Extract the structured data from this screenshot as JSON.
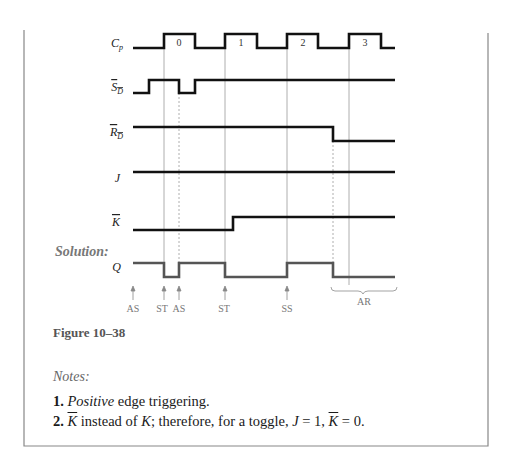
{
  "figure": {
    "caption": "Figure 10–38",
    "solution_label": "Solution:",
    "signals": [
      {
        "name": "Cp",
        "label_main": "C",
        "label_sub": "p",
        "overbar": false
      },
      {
        "name": "SD",
        "label_main": "S",
        "label_sub": "D",
        "overbar": true
      },
      {
        "name": "RD",
        "label_main": "R",
        "label_sub": "D",
        "overbar": true
      },
      {
        "name": "J",
        "label_main": "J",
        "label_sub": "",
        "overbar": false
      },
      {
        "name": "K",
        "label_main": "K",
        "label_sub": "",
        "overbar": true
      },
      {
        "name": "Q",
        "label_main": "Q",
        "label_sub": "",
        "overbar": false
      }
    ],
    "clock_pulses": [
      "0",
      "1",
      "2",
      "3"
    ],
    "event_labels": [
      "AS",
      "ST",
      "AS",
      "ST",
      "SS"
    ],
    "brace_label": "AR"
  },
  "notes": {
    "heading": "Notes:",
    "items": [
      {
        "num": "1.",
        "em": "Positive",
        "text": " edge triggering."
      },
      {
        "num": "2.",
        "k": "K",
        "text1": " instead of ",
        "k2": "K",
        "text2": "; therefore, for a toggle, ",
        "j": "J",
        "text3": " = 1, ",
        "k3": "K",
        "text4": " = 0."
      }
    ]
  }
}
